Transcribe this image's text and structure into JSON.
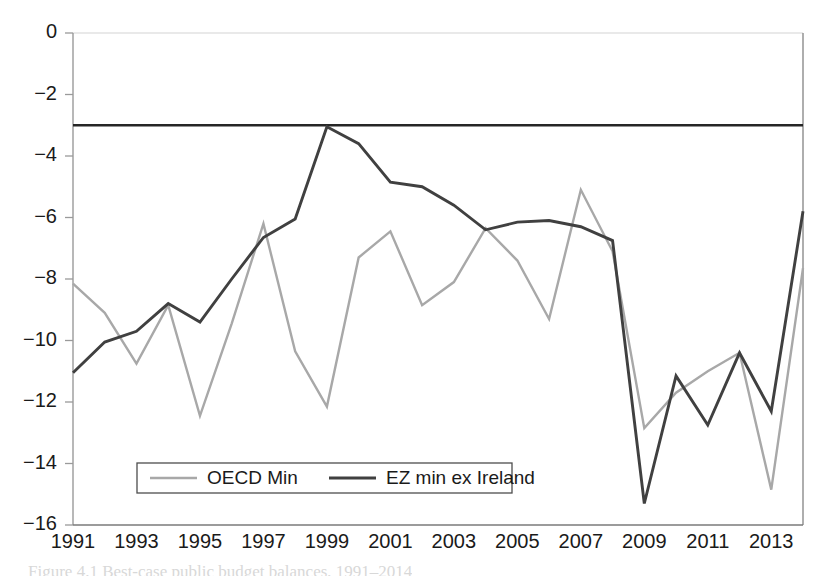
{
  "chart_data": {
    "type": "line",
    "title": "",
    "subtitle": "",
    "xlabel": "",
    "ylabel": "",
    "x": [
      1991,
      1992,
      1993,
      1994,
      1995,
      1996,
      1997,
      1998,
      1999,
      2000,
      2001,
      2002,
      2003,
      2004,
      2005,
      2006,
      2007,
      2008,
      2009,
      2010,
      2011,
      2012,
      2013,
      2014
    ],
    "xtick_labels": [
      "1991",
      "1993",
      "1995",
      "1997",
      "1999",
      "2001",
      "2003",
      "2005",
      "2007",
      "2009",
      "2011",
      "2013"
    ],
    "xtick_values": [
      1991,
      1993,
      1995,
      1997,
      1999,
      2001,
      2003,
      2005,
      2007,
      2009,
      2011,
      2013
    ],
    "ytick_labels": [
      "0",
      "-2",
      "-4",
      "-6",
      "-8",
      "-10",
      "-12",
      "-14",
      "-16"
    ],
    "ytick_values": [
      0,
      -2,
      -4,
      -6,
      -8,
      -10,
      -12,
      -14,
      -16
    ],
    "xlim": [
      1991,
      2014
    ],
    "ylim": [
      -16,
      0
    ],
    "grid": false,
    "legend_position": "bottom-left-inside",
    "reference_line": {
      "label": "-3% deficit limit",
      "value": -3,
      "color": "#262626",
      "width": 2.6
    },
    "series": [
      {
        "name": "OECD Min",
        "color": "#a8a8a8",
        "width": 2.4,
        "values": [
          -8.15,
          -9.1,
          -10.75,
          -8.85,
          -12.45,
          -9.45,
          -6.2,
          -10.35,
          -12.15,
          -7.3,
          -6.45,
          -8.85,
          -8.1,
          -6.35,
          -7.4,
          -9.3,
          -5.1,
          -7.1,
          -12.85,
          -11.7,
          -11.0,
          -10.4,
          -14.85,
          -7.65
        ]
      },
      {
        "name": "EZ min ex Ireland",
        "color": "#404040",
        "width": 2.9,
        "values": [
          -11.05,
          -10.05,
          -9.7,
          -8.8,
          -9.4,
          -8.0,
          -6.65,
          -6.05,
          -3.05,
          -3.6,
          -4.85,
          -5.0,
          -5.6,
          -6.4,
          -6.15,
          -6.1,
          -6.3,
          -6.75,
          -15.3,
          -11.15,
          -12.75,
          -10.4,
          -12.3,
          -5.8
        ]
      }
    ],
    "legend": [
      {
        "label": "OECD Min",
        "color": "#a8a8a8",
        "width": 2.4
      },
      {
        "label": "EZ min ex Ireland",
        "color": "#404040",
        "width": 2.9
      }
    ]
  },
  "caption": {
    "text": "Figure 4.1  Best-case public budget balances, 1991–2014"
  },
  "colors": {
    "axis": "#8c8c8c",
    "text": "#1a1a1a",
    "background": "#ffffff",
    "series_light": "#a8a8a8",
    "series_dark": "#404040"
  }
}
